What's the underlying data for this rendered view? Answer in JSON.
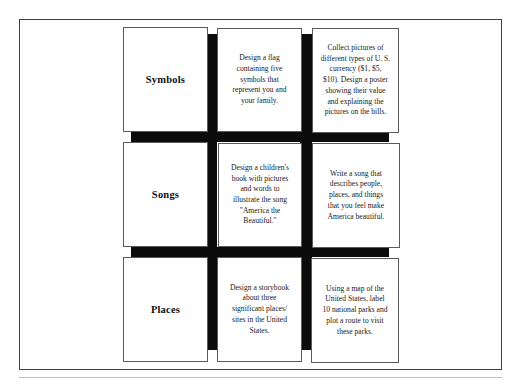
{
  "choice_board": {
    "rows": [
      {
        "label": "Symbols",
        "tasks": [
          {
            "lines": [
              "Design a flag",
              "containing five",
              "symbols that",
              "represent you and",
              "your family."
            ]
          },
          {
            "lines": [
              "Collect pictures of",
              "different types of U. S.",
              "currency ($1, $5,",
              "$10). Design a poster",
              "showing their value",
              "and explaining the",
              "pictures on the bills."
            ]
          }
        ]
      },
      {
        "label": "Songs",
        "tasks": [
          {
            "lines": [
              "Design a children's",
              "book with pictures",
              "and words to",
              "illustrate the song",
              "\"America the",
              "Beautiful.\""
            ]
          },
          {
            "lines": [
              "Write a song that",
              "describes people,",
              "places, and things",
              "that you feel make",
              "America beautiful."
            ]
          }
        ]
      },
      {
        "label": "Places",
        "tasks": [
          {
            "lines": [
              "Design a storybook",
              "about three",
              "significant places/",
              "sites in the United",
              "States."
            ]
          },
          {
            "lines": [
              "Using a map of the",
              "United States, label",
              "10 national parks and",
              "plot a route to visit",
              "these parks."
            ]
          }
        ]
      }
    ]
  },
  "colors": {
    "grid_bars": "#0b0b0b",
    "card_border": "#5a5a5a",
    "frame_border": "#3f3f3f",
    "background": "#ffffff"
  }
}
